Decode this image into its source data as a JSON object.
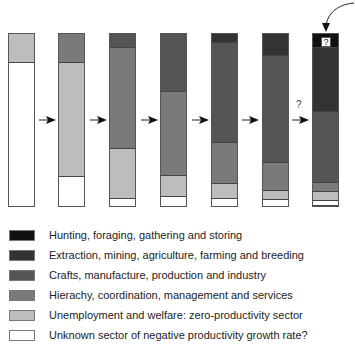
{
  "colors": {
    "hunting": "#111111",
    "extraction": "#333333",
    "crafts": "#555555",
    "hierarchy": "#7a7a7a",
    "unemployment": "#bdbdbd",
    "unknown": "#ffffff"
  },
  "legend": [
    {
      "key": "hunting",
      "label": "Hunting, foraging, gathering and storing"
    },
    {
      "key": "extraction",
      "label": "Extraction, mining, agriculture, farming and breeding"
    },
    {
      "key": "crafts",
      "label": "Crafts, manufacture, production and industry"
    },
    {
      "key": "hierarchy",
      "label": "Hierachy, coordination, management and services"
    },
    {
      "key": "unemployment",
      "label": "Unemployment and welfare: zero-productivity sector"
    },
    {
      "key": "unknown",
      "label": "Unknown sector of negative productivity growth rate?"
    }
  ],
  "annotations": {
    "transition_question": "?",
    "box_question": "?"
  },
  "chart_data": {
    "type": "bar",
    "stacked": true,
    "title": "",
    "xlabel": "",
    "ylabel": "",
    "categories": [
      "Stage 1",
      "Stage 2",
      "Stage 3",
      "Stage 4",
      "Stage 5",
      "Stage 6",
      "Stage 7"
    ],
    "series": [
      {
        "name": "Hunting, foraging, gathering and storing",
        "values": [
          0,
          0,
          0,
          0,
          0,
          0,
          8
        ]
      },
      {
        "name": "Extraction, mining, agriculture, farming and breeding",
        "values": [
          0,
          0,
          0,
          0,
          5,
          13,
          37
        ]
      },
      {
        "name": "Crafts, manufacture, production and industry",
        "values": [
          0,
          0,
          8,
          34,
          58,
          62,
          41
        ]
      },
      {
        "name": "Hierachy, coordination, management and services",
        "values": [
          0,
          17,
          59,
          49,
          24,
          16,
          5
        ]
      },
      {
        "name": "Unemployment and welfare: zero-productivity sector",
        "values": [
          17,
          66,
          29,
          12,
          9,
          5,
          5
        ]
      },
      {
        "name": "Unknown sector of negative productivity growth rate?",
        "values": [
          83,
          17,
          4,
          5,
          4,
          4,
          4
        ]
      }
    ],
    "units": "percent share of bar height (estimated)",
    "order_top_to_bottom": [
      "hunting",
      "extraction",
      "crafts",
      "hierarchy",
      "unemployment",
      "unknown"
    ],
    "legend_position": "bottom"
  }
}
